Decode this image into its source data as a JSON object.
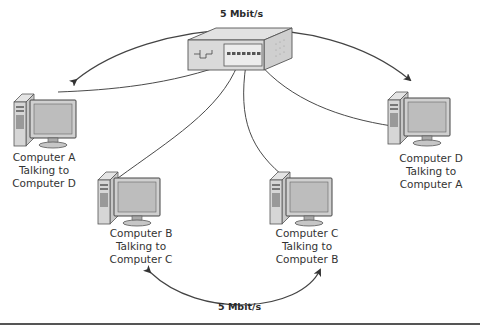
{
  "diagram": {
    "type": "network-switch",
    "switch": {
      "label": "",
      "icon": "network-switch-icon"
    },
    "links": [
      {
        "from": "Computer A",
        "to": "Computer D",
        "speed": "5 Mbit/s",
        "position": "top"
      },
      {
        "from": "Computer B",
        "to": "Computer C",
        "speed": "5 Mbit/s",
        "position": "bottom"
      }
    ],
    "computers": [
      {
        "id": "A",
        "lines": [
          "Computer A",
          "Talking to",
          "Computer D"
        ]
      },
      {
        "id": "B",
        "lines": [
          "Computer B",
          "Talking to",
          "Computer C"
        ]
      },
      {
        "id": "C",
        "lines": [
          "Computer C",
          "Talking to",
          "Computer B"
        ]
      },
      {
        "id": "D",
        "lines": [
          "Computer D",
          "Talking to",
          "Computer A"
        ]
      }
    ],
    "colors": {
      "line": "#444444",
      "device_fill": "#d9d9d9",
      "device_stroke": "#555555",
      "screen": "#bfbfbf"
    }
  }
}
